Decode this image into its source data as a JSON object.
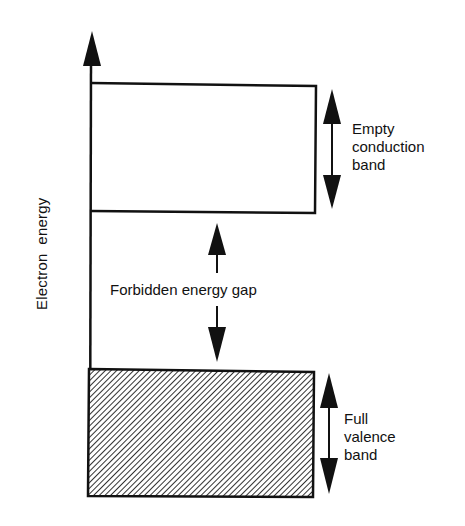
{
  "diagram": {
    "type": "energy-band-diagram",
    "axis_label": "Electron  energy",
    "bands": [
      {
        "id": "conduction",
        "label_lines": [
          "Empty",
          "conduction",
          "band"
        ],
        "fill": "none"
      },
      {
        "id": "valence",
        "label_lines": [
          "Full",
          "valence",
          "band"
        ],
        "fill": "hatched"
      }
    ],
    "gap_label": "Forbidden energy gap",
    "colors": {
      "line": "#111111",
      "background": "#ffffff"
    }
  }
}
